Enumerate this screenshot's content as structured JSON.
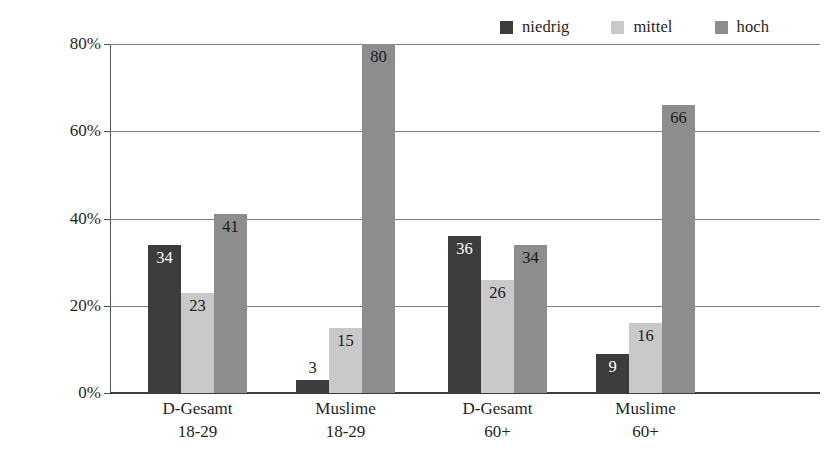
{
  "chart_data": {
    "type": "bar",
    "title": "",
    "subtitle": "",
    "xlabel": "",
    "ylabel": "",
    "ylim": [
      0,
      80
    ],
    "ytick_values": [
      0,
      20,
      40,
      60,
      80
    ],
    "ytick_labels": [
      "0%",
      "20%",
      "40%",
      "60%",
      "80%"
    ],
    "grid": true,
    "legend_position": "top-right",
    "categories": [
      {
        "line1": "D-Gesamt",
        "line2": "18-29"
      },
      {
        "line1": "Muslime",
        "line2": "18-29"
      },
      {
        "line1": "D-Gesamt",
        "line2": "60+"
      },
      {
        "line1": "Muslime",
        "line2": "60+"
      }
    ],
    "series": [
      {
        "name": "niedrig",
        "color": "#3c3c3c",
        "values": [
          34,
          3,
          36,
          9
        ],
        "label_colors": [
          "#ffffff",
          "#1a1a1a",
          "#ffffff",
          "#ffffff"
        ]
      },
      {
        "name": "mittel",
        "color": "#c9c9c9",
        "values": [
          23,
          15,
          26,
          16
        ],
        "label_colors": [
          "#1a1a1a",
          "#1a1a1a",
          "#1a1a1a",
          "#1a1a1a"
        ]
      },
      {
        "name": "hoch",
        "color": "#8d8d8d",
        "values": [
          41,
          80,
          34,
          66
        ],
        "label_colors": [
          "#1a1a1a",
          "#1a1a1a",
          "#1a1a1a",
          "#1a1a1a"
        ]
      }
    ]
  }
}
